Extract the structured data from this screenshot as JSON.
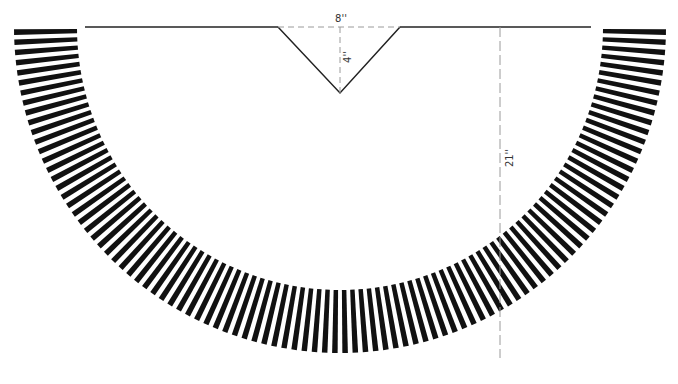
{
  "diagram": {
    "type": "sewing-pattern-circle-skirt-with-v-notch",
    "labels": {
      "width": "8''",
      "depth": "4''",
      "length": "21''"
    },
    "colors": {
      "stripe": "#111111",
      "line": "#222222",
      "dashed": "#9a9a9a",
      "background": "#ffffff"
    },
    "geometry": {
      "center_x": 340,
      "center_y": 27,
      "outer_radius": 326,
      "inner_radius": 263,
      "stripe_count": 100,
      "top_line_y": 27,
      "notch_left_x": 278,
      "notch_right_x": 400,
      "notch_bottom_y": 93,
      "dim_line_x": 500,
      "dim_line_bottom_y": 358
    }
  }
}
